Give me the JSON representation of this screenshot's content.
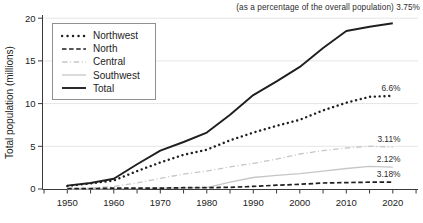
{
  "header": {
    "annotation": "(as a percentage of the overall population) 3.75%"
  },
  "colors": {
    "black_line": "#1f1f1f",
    "light_line": "#c6c6c6",
    "grid": "#e5e5e5",
    "axis": "#3a3a3a",
    "text": "#222222",
    "annotation_text": "#2c2c2c",
    "background": "#ffffff"
  },
  "chart_data": {
    "type": "line",
    "title": "",
    "xlabel": "",
    "ylabel": "Total population (millions)",
    "ylim": [
      0,
      20
    ],
    "yticks": [
      0,
      5,
      10,
      15,
      20
    ],
    "xtick_labels": [
      "1950",
      "1960",
      "1970",
      "1980",
      "1990",
      "2000",
      "2010",
      "2020"
    ],
    "minor_xtick_step_years": 5,
    "grid": "horizontal light gridlines at 5, 10, 15, 20",
    "legend_position": "upper left",
    "top_annotation": "(as a percentage of the overall population) 3.75%",
    "x": [
      1950,
      1955,
      1960,
      1965,
      1970,
      1975,
      1980,
      1985,
      1990,
      1995,
      2000,
      2005,
      2010,
      2015,
      2020
    ],
    "series": [
      {
        "name": "Northwest",
        "style": "dotted",
        "color": "#1f1f1f",
        "end_label": "6.6%",
        "values": [
          0.35,
          0.65,
          1.0,
          2.1,
          3.1,
          4.0,
          4.6,
          5.7,
          6.6,
          7.4,
          8.1,
          9.2,
          10.1,
          10.8,
          10.9
        ]
      },
      {
        "name": "North",
        "style": "dashed",
        "color": "#1f1f1f",
        "end_label": "3.18%",
        "values": [
          0.05,
          0.05,
          0.1,
          0.1,
          0.1,
          0.15,
          0.15,
          0.2,
          0.3,
          0.45,
          0.55,
          0.7,
          0.75,
          0.8,
          0.8
        ]
      },
      {
        "name": "Central",
        "style": "dashdot",
        "color": "#c6c6c6",
        "end_label": "3.11%",
        "values": [
          0.05,
          0.1,
          0.3,
          0.7,
          1.25,
          1.75,
          2.1,
          2.6,
          3.0,
          3.5,
          4.1,
          4.5,
          4.8,
          5.0,
          4.9
        ]
      },
      {
        "name": "Southwest",
        "style": "solid-light",
        "color": "#c6c6c6",
        "end_label": "2.12%",
        "values": [
          0.0,
          0.0,
          0.05,
          0.05,
          0.1,
          0.1,
          0.15,
          0.8,
          1.35,
          1.6,
          1.8,
          2.1,
          2.4,
          2.65,
          2.55
        ]
      },
      {
        "name": "Total",
        "style": "solid",
        "color": "#1f1f1f",
        "end_label": null,
        "values": [
          0.4,
          0.7,
          1.2,
          2.9,
          4.5,
          5.5,
          6.6,
          8.7,
          11.0,
          12.6,
          14.3,
          16.5,
          18.5,
          19.0,
          19.4
        ]
      }
    ]
  }
}
